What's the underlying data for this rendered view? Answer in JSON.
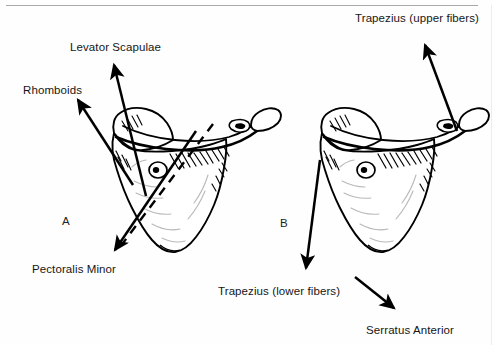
{
  "figure": {
    "background_color": "#fefefe",
    "ink_color": "#000000",
    "width": 492,
    "height": 345
  },
  "panels": [
    {
      "letter": "A",
      "x": 62,
      "y": 215,
      "description": "Left scapula, posterior view, with elevator and depressor muscle vectors"
    },
    {
      "letter": "B",
      "x": 280,
      "y": 217,
      "description": "Right scapula, posterior view, with trapezius and serratus anterior vectors"
    }
  ],
  "labels": [
    {
      "id": "levator-scapulae",
      "text": "Levator Scapulae",
      "x": 70,
      "y": 41,
      "panel": "A"
    },
    {
      "id": "rhomboids",
      "text": "Rhomboids",
      "x": 23,
      "y": 84,
      "panel": "A"
    },
    {
      "id": "pectoralis-minor",
      "text": "Pectoralis Minor",
      "x": 32,
      "y": 263,
      "panel": "A"
    },
    {
      "id": "trapezius-upper-fibers",
      "text": "Trapezius (upper fibers)",
      "x": 355,
      "y": 12,
      "panel": "B"
    },
    {
      "id": "trapezius-lower-fibers",
      "text": "Trapezius (lower fibers)",
      "x": 218,
      "y": 285,
      "panel": "B"
    },
    {
      "id": "serratus-anterior",
      "text": "Serratus Anterior",
      "x": 366,
      "y": 324,
      "panel": "B"
    }
  ],
  "arrows": [
    {
      "id": "levator-scapulae-arrow",
      "panel": "A",
      "from_x": 146,
      "from_y": 196,
      "to_x": 112,
      "to_y": 62,
      "direction": "up-left"
    },
    {
      "id": "rhomboids-arrow",
      "panel": "A",
      "from_x": 133,
      "from_y": 185,
      "to_x": 76,
      "to_y": 97,
      "direction": "up-left"
    },
    {
      "id": "pectoralis-minor-arrow",
      "panel": "A",
      "from_x": 196,
      "from_y": 131,
      "to_x": 112,
      "to_y": 254,
      "direction": "down-left"
    },
    {
      "id": "trapezius-upper-fibers-arrow",
      "panel": "B",
      "from_x": 457,
      "from_y": 131,
      "to_x": 423,
      "to_y": 41,
      "direction": "up-left"
    },
    {
      "id": "trapezius-lower-fibers-arrow",
      "panel": "B",
      "from_x": 320,
      "from_y": 160,
      "to_x": 305,
      "to_y": 272,
      "direction": "down"
    },
    {
      "id": "serratus-anterior-arrow",
      "panel": "B",
      "from_x": 355,
      "from_y": 277,
      "to_x": 397,
      "to_y": 311,
      "direction": "down-right"
    }
  ],
  "axis_line": {
    "id": "scapula-axis-dashed-line",
    "panel": "A",
    "style": "dashed",
    "from_x": 213,
    "from_y": 124,
    "to_x": 123,
    "to_y": 243
  }
}
